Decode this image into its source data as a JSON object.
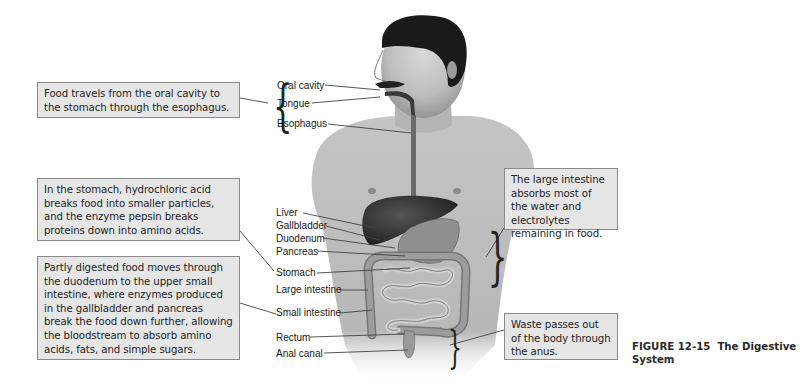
{
  "figure": {
    "caption_number": "FIGURE 12-15",
    "caption_title": "The Digestive System"
  },
  "callouts": {
    "esophagus": "Food travels from the oral cavity to the stomach through the esophagus.",
    "stomach": "In the stomach, hydrochloric acid breaks food into smaller particles, and the enzyme pepsin breaks proteins down into amino acids.",
    "small_intestine": "Partly digested food moves through the duodenum to the upper small intestine, where enzymes produced in the gallbladder and pancreas break the food down further, allowing the bloodstream to absorb amino acids, fats, and simple sugars.",
    "large_intestine": "The large intestine absorbs most of the water and electrolytes remaining in food.",
    "waste": "Waste passes out of the body through the anus."
  },
  "labels": {
    "oral_cavity": "Oral cavity",
    "tongue": "Tongue",
    "esophagus": "Esophagus",
    "liver": "Liver",
    "gallbladder": "Gallbladder",
    "duodenum": "Duodenum",
    "pancreas": "Pancreas",
    "stomach": "Stomach",
    "large_intestine": "Large intestine",
    "small_intestine": "Small intestine",
    "rectum": "Rectum",
    "anal_canal": "Anal canal"
  },
  "colors": {
    "callout_fill": "#e6e6e6",
    "callout_border": "#8a8a8a",
    "leader_line": "#444444"
  }
}
